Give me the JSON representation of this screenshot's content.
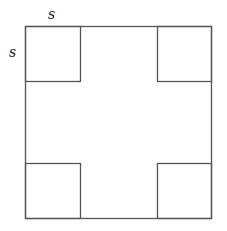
{
  "diagram": {
    "type": "geometry",
    "stroke_color": "#555555",
    "background": "#ffffff",
    "outer_square": {
      "x": 25,
      "y": 26,
      "width": 187,
      "height": 193
    },
    "corner_square_side_px": 55,
    "corner_squares": [
      {
        "name": "top-left",
        "x": 25,
        "y": 26
      },
      {
        "name": "top-right",
        "x": 157,
        "y": 26
      },
      {
        "name": "bottom-left",
        "x": 25,
        "y": 164
      },
      {
        "name": "bottom-right",
        "x": 157,
        "y": 164
      }
    ],
    "labels": {
      "top_side": "s",
      "left_side": "s"
    }
  }
}
